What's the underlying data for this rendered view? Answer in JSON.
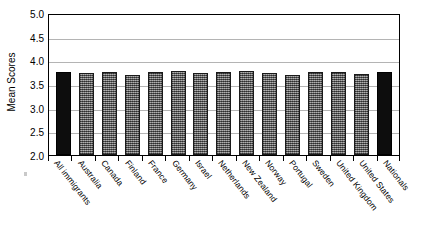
{
  "chart_data": {
    "type": "bar",
    "title": "",
    "xlabel": "",
    "ylabel": "Mean Scores",
    "ylim": [
      2.0,
      5.0
    ],
    "ytick_labels": [
      "5.0",
      "4.5",
      "4.0",
      "3.5",
      "3.0",
      "2.5",
      "2.0"
    ],
    "ytick_values": [
      5.0,
      4.5,
      4.0,
      3.5,
      3.0,
      2.5,
      2.0
    ],
    "grid": true,
    "legend": "none",
    "categories": [
      "All immigrants",
      "Australia",
      "Canada",
      "Finland",
      "France",
      "Germany",
      "Israel",
      "Netherlands",
      "New Zealand",
      "Norway",
      "Portugal",
      "Sweden",
      "United Kingdom",
      "United States",
      "Nationals"
    ],
    "values": [
      3.76,
      3.74,
      3.75,
      3.7,
      3.76,
      3.77,
      3.73,
      3.75,
      3.78,
      3.73,
      3.68,
      3.75,
      3.76,
      3.72,
      3.75
    ],
    "bar_styles": [
      "solid",
      "hatch",
      "hatch",
      "hatch",
      "hatch",
      "hatch",
      "hatch",
      "hatch",
      "hatch",
      "hatch",
      "hatch",
      "hatch",
      "hatch",
      "hatch",
      "solid"
    ],
    "colors": {
      "solid_bar": "#0d0d0d",
      "hatch_bar": "#7a7a7a",
      "bar_edge": "#1a1a1a",
      "gridline": "#b4b4b4",
      "axis": "#000000",
      "background": "#ffffff"
    }
  }
}
